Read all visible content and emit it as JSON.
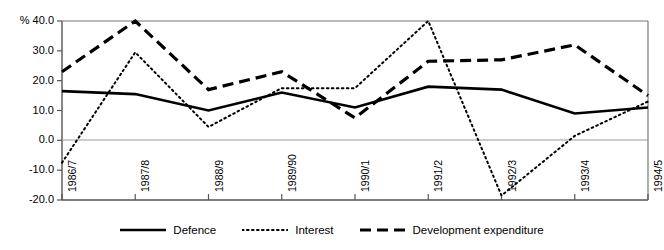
{
  "chart_data": {
    "type": "line",
    "title": "",
    "xlabel": "",
    "ylabel": "%",
    "unit_label": "%",
    "categories": [
      "1986/7",
      "1987/8",
      "1988/9",
      "1989/90",
      "1990/1",
      "1991/2",
      "1992/3",
      "1993/4",
      "1994/5"
    ],
    "ylim": [
      -20.0,
      40.0
    ],
    "ytick_labels": [
      "% 40.0",
      "30.0",
      "20.0",
      "10.0",
      "0.0",
      "-10.0",
      "-20.0"
    ],
    "yticks": [
      40.0,
      30.0,
      20.0,
      10.0,
      0.0,
      -10.0,
      -20.0
    ],
    "grid": false,
    "zero_line": true,
    "legend_position": "bottom",
    "series": [
      {
        "name": "Defence",
        "style": "solid",
        "color": "#000000",
        "values": [
          16.5,
          15.5,
          10.0,
          16.0,
          11.0,
          18.0,
          17.0,
          9.0,
          11.0
        ]
      },
      {
        "name": "Interest",
        "style": "dotted",
        "color": "#000000",
        "values": [
          -7.5,
          29.5,
          4.5,
          17.5,
          17.5,
          40.0,
          -18.5,
          1.5,
          13.0
        ]
      },
      {
        "name": "Development expenditure",
        "style": "dashed",
        "color": "#000000",
        "values": [
          23.0,
          40.0,
          17.0,
          23.0,
          7.5,
          26.5,
          27.0,
          32.0,
          15.0
        ]
      }
    ]
  },
  "legend": {
    "items": [
      {
        "label": "Defence",
        "style": "solid"
      },
      {
        "label": "Interest",
        "style": "dotted"
      },
      {
        "label": "Development expenditure",
        "style": "dashed"
      }
    ]
  }
}
